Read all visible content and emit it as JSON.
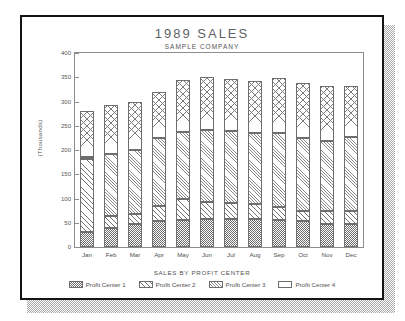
{
  "chart_data": {
    "type": "bar",
    "stacked": true,
    "title": "1989 SALES",
    "subtitle": "SAMPLE COMPANY",
    "xlabel": "SALES BY PROFIT CENTER",
    "ylabel": "(Thousands)",
    "ylim": [
      0,
      400
    ],
    "yticks": [
      0,
      50,
      100,
      150,
      200,
      250,
      300,
      350,
      400
    ],
    "ytick_labels": [
      "0",
      "50",
      "100",
      "150",
      "200",
      "250",
      "300",
      "350",
      "400"
    ],
    "grid": false,
    "legend_position": "bottom",
    "categories": [
      "Jan",
      "Feb",
      "Mar",
      "Apr",
      "May",
      "Jun",
      "Jul",
      "Aug",
      "Sep",
      "Oct",
      "Nov",
      "Dec"
    ],
    "series": [
      {
        "name": "Profit Center 1",
        "pattern": "dense-checker",
        "values": [
          31,
          40,
          47,
          54,
          56,
          57,
          57,
          58,
          56,
          53,
          48,
          47
        ]
      },
      {
        "name": "Profit Center 2",
        "pattern": "diagonal-lines",
        "values": [
          150,
          23,
          22,
          30,
          42,
          36,
          34,
          31,
          27,
          22,
          27,
          27
        ]
      },
      {
        "name": "Profit Center 3",
        "pattern": "tight-diagonal",
        "values": [
          5,
          129,
          132,
          140,
          139,
          148,
          148,
          147,
          153,
          150,
          144,
          152
        ]
      },
      {
        "name": "Profit Center 4",
        "pattern": "cross-hatch",
        "values": [
          95,
          100,
          99,
          95,
          107,
          110,
          108,
          107,
          112,
          113,
          113,
          105
        ]
      }
    ],
    "totals": [
      281,
      292,
      300,
      319,
      344,
      351,
      347,
      343,
      348,
      338,
      332,
      331
    ]
  },
  "legend": {
    "items": [
      {
        "label": "Profit Center 1"
      },
      {
        "label": "Profit Center 2"
      },
      {
        "label": "Profit Center 3"
      },
      {
        "label": "Profit Center 4"
      }
    ]
  },
  "colors": {
    "ink": "#141414",
    "axis": "#8d8d8d",
    "text": "#4f4f4f",
    "hatch": "#6e6e6e",
    "page": "#ffffff",
    "shadow": "#9a9a9a"
  }
}
